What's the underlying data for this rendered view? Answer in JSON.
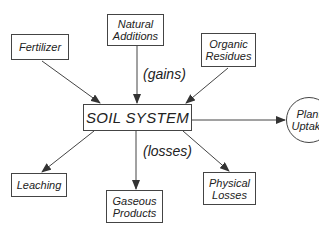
{
  "diagram": {
    "center": {
      "label": "SOIL SYSTEM"
    },
    "inputs": [
      {
        "id": "fertilizer",
        "label": "Fertilizer"
      },
      {
        "id": "natural-additions",
        "label": "Natural Additions"
      },
      {
        "id": "organic-residues",
        "label": "Organic Residues"
      }
    ],
    "outputs": [
      {
        "id": "leaching",
        "label": "Leaching"
      },
      {
        "id": "gaseous-products",
        "label": "Gaseous Products"
      },
      {
        "id": "physical-losses",
        "label": "Physical Losses"
      },
      {
        "id": "plant-uptake",
        "label": "Plant Uptake"
      }
    ],
    "annotations": {
      "gains": "(gains)",
      "losses": "(losses)"
    },
    "edges": [
      {
        "from": "Fertilizer",
        "to": "SOIL SYSTEM"
      },
      {
        "from": "Natural Additions",
        "to": "SOIL SYSTEM"
      },
      {
        "from": "Organic Residues",
        "to": "SOIL SYSTEM"
      },
      {
        "from": "SOIL SYSTEM",
        "to": "Leaching"
      },
      {
        "from": "SOIL SYSTEM",
        "to": "Gaseous Products"
      },
      {
        "from": "SOIL SYSTEM",
        "to": "Physical Losses"
      },
      {
        "from": "SOIL SYSTEM",
        "to": "Plant Uptake"
      }
    ]
  }
}
